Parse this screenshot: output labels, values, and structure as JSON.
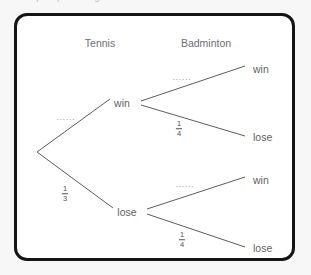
{
  "page": {
    "top_clipped_text": "sample space diagram",
    "background_color": "#f7f7f7",
    "frame_color": "#151515",
    "frame_fill": "#ffffff"
  },
  "diagram": {
    "type": "probability-tree",
    "stage_headers": [
      {
        "label": "Tennis",
        "x": 100,
        "y": 37
      },
      {
        "label": "Badminton",
        "x": 206,
        "y": 37
      }
    ],
    "root": {
      "x": 37,
      "y": 152
    },
    "nodes": [
      {
        "id": "tennis-win",
        "label": "win",
        "x": 122,
        "y": 103,
        "align": "center"
      },
      {
        "id": "tennis-lose",
        "label": "lose",
        "x": 127,
        "y": 212,
        "align": "center"
      },
      {
        "id": "bad-win-win",
        "label": "win",
        "x": 253,
        "y": 69,
        "align": "left"
      },
      {
        "id": "bad-win-lose",
        "label": "lose",
        "x": 253,
        "y": 137,
        "align": "left"
      },
      {
        "id": "bad-lose-win",
        "label": "win",
        "x": 253,
        "y": 180,
        "align": "left"
      },
      {
        "id": "bad-lose-lose",
        "label": "lose",
        "x": 253,
        "y": 248,
        "align": "left"
      }
    ],
    "edges": [
      {
        "id": "root-to-win",
        "x1": 37,
        "y1": 152,
        "x2": 110,
        "y2": 99
      },
      {
        "id": "root-to-lose",
        "x1": 37,
        "y1": 152,
        "x2": 113,
        "y2": 208
      },
      {
        "id": "win-to-win",
        "x1": 141,
        "y1": 101,
        "x2": 245,
        "y2": 66
      },
      {
        "id": "win-to-lose",
        "x1": 141,
        "y1": 105,
        "x2": 245,
        "y2": 136
      },
      {
        "id": "lose-to-win",
        "x1": 147,
        "y1": 209,
        "x2": 245,
        "y2": 177
      },
      {
        "id": "lose-to-lose",
        "x1": 147,
        "y1": 214,
        "x2": 245,
        "y2": 247
      }
    ],
    "edge_labels": [
      {
        "id": "p-tennis-win",
        "kind": "dots",
        "text": "......",
        "x": 66,
        "y": 118
      },
      {
        "id": "p-tennis-lose",
        "kind": "fraction",
        "numerator": "1",
        "denominator": "3",
        "x": 65,
        "y": 194
      },
      {
        "id": "p-bad-win-win",
        "kind": "dots",
        "text": "......",
        "x": 182,
        "y": 78
      },
      {
        "id": "p-bad-win-lose",
        "kind": "fraction",
        "numerator": "1",
        "denominator": "4",
        "x": 179,
        "y": 129
      },
      {
        "id": "p-bad-lose-win",
        "kind": "dots",
        "text": "......",
        "x": 185,
        "y": 185
      },
      {
        "id": "p-bad-lose-lose",
        "kind": "fraction",
        "numerator": "1",
        "denominator": "4",
        "x": 182,
        "y": 240
      }
    ]
  }
}
